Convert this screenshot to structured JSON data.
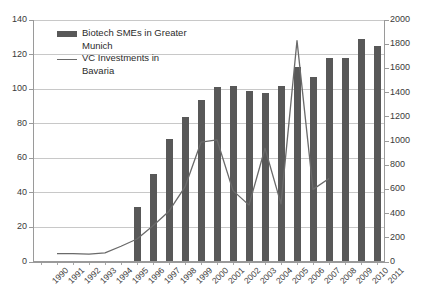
{
  "chart_data": {
    "type": "bar",
    "title": "",
    "xlabel": "",
    "ylabel": "",
    "grid": true,
    "legend_position": "top-left",
    "categories": [
      "1990",
      "1991",
      "1992",
      "1993",
      "1994",
      "1995",
      "1996",
      "1997",
      "1998",
      "1999",
      "2000",
      "2001",
      "2002",
      "2003",
      "2004",
      "2005",
      "2006",
      "2007",
      "2008",
      "2009",
      "2010",
      "2011"
    ],
    "left_axis": {
      "ticks": [
        0,
        20,
        40,
        60,
        80,
        100,
        120,
        140
      ],
      "ylim": [
        0,
        140
      ]
    },
    "right_axis": {
      "ticks": [
        0,
        200,
        400,
        600,
        800,
        1000,
        1200,
        1400,
        1600,
        1800,
        2000
      ],
      "ylim": [
        0,
        2000
      ]
    },
    "series": [
      {
        "name": "Biotech SMEs in Greater Munich",
        "type": "bar",
        "axis": "left",
        "color": "#585858",
        "values": [
          0,
          0,
          0,
          0,
          0,
          0,
          32,
          51,
          71,
          84,
          94,
          101,
          102,
          99,
          98,
          102,
          113,
          107,
          118,
          118,
          129,
          125
        ]
      },
      {
        "name": "VC Investments in Bavaria",
        "type": "line",
        "axis": "right",
        "color": "#6a6a6a",
        "values": [
          null,
          70,
          70,
          65,
          75,
          130,
          190,
          300,
          420,
          620,
          990,
          1010,
          590,
          470,
          940,
          480,
          1830,
          600,
          690,
          null,
          null,
          null
        ]
      }
    ],
    "legend": [
      {
        "label_line1": "Biotech SMEs in Greater",
        "label_line2": "Munich",
        "key": "bar"
      },
      {
        "label_line1": "VC Investments in",
        "label_line2": "Bavaria",
        "key": "line"
      }
    ]
  },
  "axis_labels": {
    "left": [
      "140",
      "120",
      "100",
      "80",
      "60",
      "40",
      "20",
      "0"
    ],
    "right": [
      "2000",
      "1800",
      "1600",
      "1400",
      "1200",
      "1000",
      "800",
      "600",
      "400",
      "200",
      "0"
    ],
    "bottom": [
      "1990",
      "1991",
      "1992",
      "1993",
      "1994",
      "1995",
      "1996",
      "1997",
      "1998",
      "1999",
      "2000",
      "2001",
      "2002",
      "2003",
      "2004",
      "2005",
      "2006",
      "2007",
      "2008",
      "2009",
      "2010",
      "2011"
    ]
  },
  "colors": {
    "bar": "#585858",
    "line": "#6a6a6a",
    "grid": "#c8c8c8",
    "axis": "#9a9a9a",
    "text": "#3a3a3a",
    "background": "#ffffff"
  }
}
